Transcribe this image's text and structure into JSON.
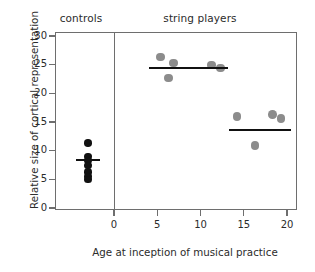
{
  "chart_data": {
    "type": "scatter",
    "title": "",
    "xlabel": "Age at inception of musical practice",
    "ylabel": "Relative size of cortical representation",
    "xlim": [
      -5,
      22
    ],
    "ylim": [
      0,
      31
    ],
    "xticks": [
      0,
      5,
      10,
      15,
      20
    ],
    "yticks": [
      0,
      5,
      10,
      15,
      20,
      25,
      30
    ],
    "grid": false,
    "legend": "none",
    "panels": [
      {
        "name": "controls",
        "label": "controls",
        "marker_color": "#111111",
        "points": [
          {
            "x": -3.0,
            "y": 11.3
          },
          {
            "x": -3.0,
            "y": 9.0
          },
          {
            "x": -3.0,
            "y": 8.3
          },
          {
            "x": -3.0,
            "y": 7.4
          },
          {
            "x": -3.0,
            "y": 6.3
          },
          {
            "x": -3.0,
            "y": 5.5
          },
          {
            "x": -3.0,
            "y": 5.0
          }
        ],
        "mean_lines": [
          {
            "y": 8.4,
            "x_start": -4.4,
            "x_end": -1.6
          }
        ]
      },
      {
        "name": "string-players",
        "label": "string players",
        "marker_color": "#8c8c8c",
        "points": [
          {
            "x": 5.4,
            "y": 26.3
          },
          {
            "x": 6.9,
            "y": 25.3
          },
          {
            "x": 6.3,
            "y": 22.7
          },
          {
            "x": 11.3,
            "y": 24.9
          },
          {
            "x": 12.3,
            "y": 24.4
          },
          {
            "x": 14.2,
            "y": 16.0
          },
          {
            "x": 16.3,
            "y": 10.9
          },
          {
            "x": 18.3,
            "y": 16.3
          },
          {
            "x": 19.3,
            "y": 15.6
          }
        ],
        "mean_lines": [
          {
            "y": 24.4,
            "x_start": 4.1,
            "x_end": 13.2
          },
          {
            "y": 13.6,
            "x_start": 13.3,
            "x_end": 20.5
          }
        ]
      }
    ]
  },
  "axis": {
    "x_tick_labels": [
      "0",
      "5",
      "10",
      "15",
      "20"
    ],
    "y_tick_labels": [
      "0",
      "5",
      "10",
      "15",
      "20",
      "25",
      "30"
    ],
    "x_title": "Age at inception of musical practice",
    "y_title": "Relative size of cortical representation"
  },
  "headings": {
    "controls": "controls",
    "string_players": "string players"
  },
  "colors": {
    "control_marker": "#111111",
    "string_marker": "#8c8c8c",
    "mean_line": "#111111",
    "axis": "#6e6e6e",
    "text": "#2b2b2b",
    "background": "#ffffff"
  }
}
